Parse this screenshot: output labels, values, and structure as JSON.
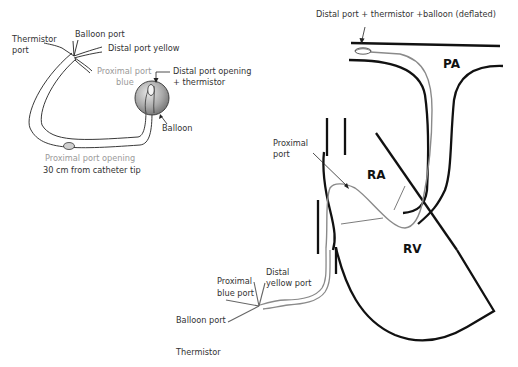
{
  "catheter_diagram": {
    "labels": {
      "thermistor_port_1": "Thermistor",
      "thermistor_port_2": "port",
      "balloon_port": "Balloon port",
      "distal_port_yellow": "Distal port yellow",
      "proximal_port_blue_1": "Proximal port",
      "proximal_port_blue_2": "blue",
      "distal_port_opening_1": "Distal port opening",
      "distal_port_opening_2": "+ thermistor",
      "balloon": "Balloon",
      "proximal_port_opening": "Proximal port opening",
      "distance_note": "30 cm from catheter tip"
    }
  },
  "heart_diagram": {
    "labels": {
      "distal_tip": "Distal port + thermistor +balloon (deflated)",
      "pa": "PA",
      "ra": "RA",
      "rv": "RV",
      "proximal_port_1": "Proximal",
      "proximal_port_2": "port",
      "proximal_blue_port_1": "Proximal",
      "proximal_blue_port_2": "blue port",
      "distal_yellow_port_1": "Distal",
      "distal_yellow_port_2": "yellow port",
      "balloon_port": "Balloon port",
      "thermistor": "Thermistor"
    }
  },
  "colors": {
    "outline": "#111111",
    "catheter": "#8a8a8a",
    "grey_text": "#9a9a9a"
  }
}
